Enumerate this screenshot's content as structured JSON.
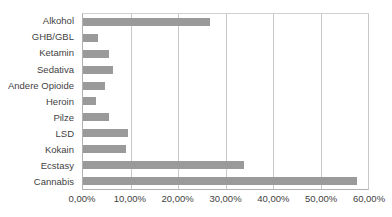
{
  "chart_data": {
    "type": "bar",
    "orientation": "horizontal",
    "title": "",
    "xlabel": "",
    "ylabel": "",
    "xlim": [
      0,
      60
    ],
    "grid": true,
    "legend": false,
    "categories": [
      "Alkohol",
      "GHB/GBL",
      "Ketamin",
      "Sedativa",
      "Andere Opioide",
      "Heroin",
      "Pilze",
      "LSD",
      "Kokain",
      "Ecstasy",
      "Cannabis"
    ],
    "values": [
      26.8,
      3.2,
      5.4,
      6.3,
      4.6,
      2.7,
      5.4,
      9.4,
      9.0,
      33.9,
      57.7
    ],
    "tick_values": [
      0,
      10,
      20,
      30,
      40,
      50,
      60
    ],
    "tick_labels": [
      "0,00%",
      "10,00%",
      "20,00%",
      "30,00%",
      "40,00%",
      "50,00%",
      "60,00%"
    ],
    "bar_color": "#9a9a9a",
    "gridline_color": "#c8c8c8",
    "axis_color": "#b0b0b0",
    "text_color": "#3f3f3f"
  }
}
